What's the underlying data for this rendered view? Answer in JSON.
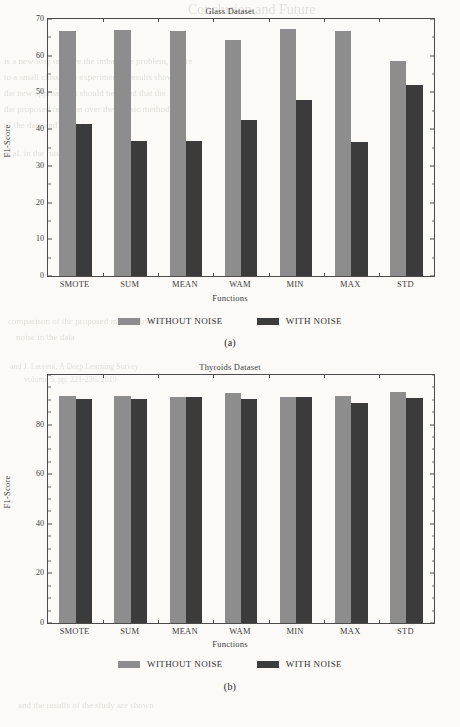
{
  "page": {
    "background_color": "#fbfaf7",
    "bleed_text": [
      {
        "text": "Conclusion and Future",
        "x": 188,
        "y": 2,
        "size": 14
      },
      {
        "text": "is a new way to solve the imbalance problem, where",
        "x": 4,
        "y": 56,
        "size": 9
      },
      {
        "text": "to a small class. The experimental results showed",
        "x": 4,
        "y": 72,
        "size": 9
      },
      {
        "text": "the new approach. It should be noted that the",
        "x": 4,
        "y": 88,
        "size": 9
      },
      {
        "text": "the proposed function over the classic methods",
        "x": 4,
        "y": 104,
        "size": 9
      },
      {
        "text": "of the data and the noise.",
        "x": 4,
        "y": 120,
        "size": 9
      },
      {
        "text": "et al. in the future work",
        "x": 4,
        "y": 148,
        "size": 9
      },
      {
        "text": "comparison of the proposed method by the",
        "x": 8,
        "y": 316,
        "size": 9
      },
      {
        "text": "noise in the data",
        "x": 16,
        "y": 332,
        "size": 9
      },
      {
        "text": "and J. Laurent, A Deep Learning Survey",
        "x": 10,
        "y": 362,
        "size": 8
      },
      {
        "text": "volume 5, pp. 221-236, 2019",
        "x": 24,
        "y": 375,
        "size": 8
      },
      {
        "text": "and the results of the study are shown",
        "x": 18,
        "y": 700,
        "size": 9
      }
    ]
  },
  "figures": [
    {
      "id": "a",
      "title": "Glass Dataset",
      "caption": "(a)",
      "xlabel": "Functions",
      "ylabel": "F1-Score",
      "chart_data": {
        "type": "bar",
        "title": "Glass Dataset",
        "xlabel": "Functions",
        "ylabel": "F1-Score",
        "ylim": [
          0,
          70
        ],
        "yticks": [
          0,
          10,
          20,
          30,
          40,
          50,
          60,
          70
        ],
        "grid": false,
        "legend_position": "below",
        "categories": [
          "SMOTE",
          "SUM",
          "MEAN",
          "WAM",
          "MIN",
          "MAX",
          "STD"
        ],
        "series": [
          {
            "name": "WITHOUT NOISE",
            "color": "#8d8d8d",
            "values": [
              66.8,
              66.9,
              66.7,
              64.3,
              67.3,
              66.8,
              58.5
            ]
          },
          {
            "name": "WITH NOISE",
            "color": "#3b3b3b",
            "values": [
              41.3,
              36.8,
              36.7,
              42.4,
              48.0,
              36.6,
              52.1
            ]
          }
        ]
      }
    },
    {
      "id": "b",
      "title": "Thyroids Dataset",
      "caption": "(b)",
      "xlabel": "Functions",
      "ylabel": "F1-Score",
      "chart_data": {
        "type": "bar",
        "title": "Thyroids Dataset",
        "xlabel": "Functions",
        "ylabel": "F1-Score",
        "ylim": [
          0,
          100
        ],
        "yticks": [
          0,
          20,
          40,
          60,
          80
        ],
        "grid": false,
        "legend_position": "below",
        "categories": [
          "SMOTE",
          "SUM",
          "MEAN",
          "WAM",
          "MIN",
          "MAX",
          "STD"
        ],
        "series": [
          {
            "name": "WITHOUT NOISE",
            "color": "#8d8d8d",
            "values": [
              91.6,
              91.4,
              91.2,
              92.6,
              91.2,
              91.7,
              93.0
            ]
          },
          {
            "name": "WITH NOISE",
            "color": "#3b3b3b",
            "values": [
              90.5,
              90.2,
              91.0,
              90.4,
              91.2,
              88.6,
              90.6
            ]
          }
        ]
      }
    }
  ],
  "legend": {
    "entries": [
      {
        "label": "WITHOUT NOISE",
        "color": "#8d8d8d"
      },
      {
        "label": "WITH NOISE",
        "color": "#3b3b3b"
      }
    ]
  }
}
